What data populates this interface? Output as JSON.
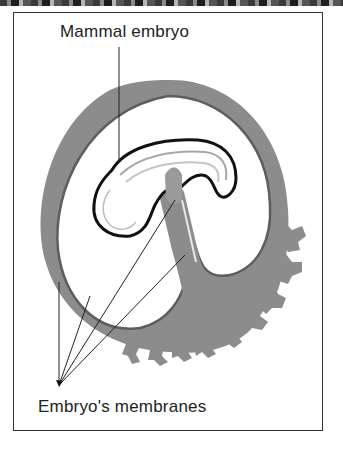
{
  "diagram": {
    "labels": {
      "embryo": "Mammal embryo",
      "membranes": "Embryo's membranes"
    },
    "colors": {
      "membrane_fill": "#8c8c8c",
      "membrane_dark": "#5e5e5e",
      "embryo_outline": "#111111",
      "leader_line": "#222222"
    }
  }
}
